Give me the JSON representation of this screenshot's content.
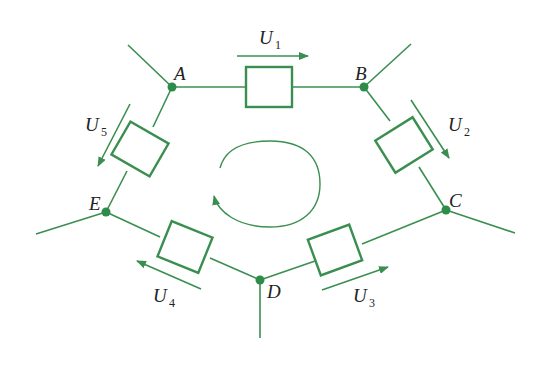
{
  "diagram": {
    "type": "circuit-loop",
    "colors": {
      "line": "#3a8f50",
      "node": "#2e8b4a",
      "text": "#222222",
      "background": "#ffffff"
    },
    "nodes": [
      {
        "id": "A",
        "label": "A",
        "x": 172,
        "y": 87
      },
      {
        "id": "B",
        "label": "B",
        "x": 364,
        "y": 87
      },
      {
        "id": "C",
        "label": "C",
        "x": 446,
        "y": 210
      },
      {
        "id": "D",
        "label": "D",
        "x": 260,
        "y": 280
      },
      {
        "id": "E",
        "label": "E",
        "x": 106,
        "y": 212
      }
    ],
    "voltages": [
      {
        "id": "U1",
        "base": "U",
        "sub": "1",
        "from": "A",
        "to": "B"
      },
      {
        "id": "U2",
        "base": "U",
        "sub": "2",
        "from": "B",
        "to": "C"
      },
      {
        "id": "U3",
        "base": "U",
        "sub": "3",
        "from": "D",
        "to": "C"
      },
      {
        "id": "U4",
        "base": "U",
        "sub": "4",
        "from": "D",
        "to": "E"
      },
      {
        "id": "U5",
        "base": "U",
        "sub": "5",
        "from": "A",
        "to": "E"
      }
    ],
    "loop_direction": "clockwise"
  }
}
